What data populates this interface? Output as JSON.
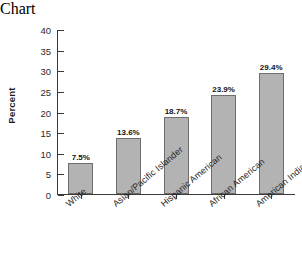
{
  "chart_data": {
    "type": "bar",
    "title": "",
    "xlabel": "",
    "ylabel": "Percent",
    "ylim": [
      0,
      40
    ],
    "ytick_step": 5,
    "yticks": [
      40,
      35,
      30,
      25,
      20,
      15,
      10,
      5,
      0
    ],
    "grid": false,
    "legend": null,
    "categories": [
      "White",
      "Asian/Pacific Islander",
      "Hispanic American",
      "African American",
      "American Indian"
    ],
    "values": [
      7.5,
      13.6,
      18.7,
      23.9,
      29.4
    ],
    "data_labels": [
      "7.5%",
      "13.6%",
      "18.7%",
      "23.9%",
      "29.4%"
    ],
    "bar_color": "#b3b3b3",
    "bar_edge_color": "#6e6e6e",
    "axis_color": "#3a3a3a",
    "background": "#ffffff"
  }
}
